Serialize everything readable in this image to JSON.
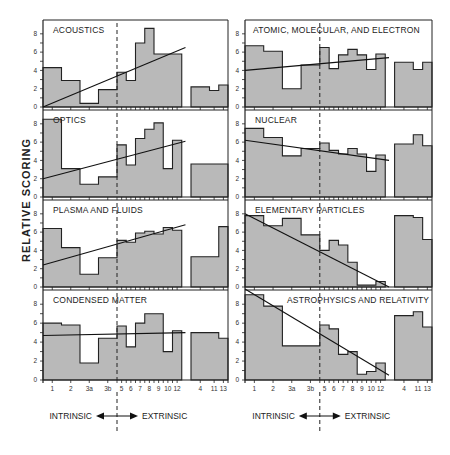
{
  "chart_data": {
    "type": "bar",
    "ylabel": "RELATIVE SCORING",
    "ylim": [
      0,
      9
    ],
    "yticks": [
      0,
      2,
      4,
      6,
      8
    ],
    "categories": [
      "1",
      "2",
      "3a",
      "3b",
      "5",
      "6",
      "7",
      "8",
      "9",
      "10",
      "12",
      "4",
      "11",
      "13"
    ],
    "intrinsic_label": "INTRINSIC",
    "extrinsic_label": "EXTRINSIC",
    "panels": [
      {
        "title": "ACOUSTICS",
        "column": "left",
        "values": [
          4.3,
          2.9,
          0.4,
          1.9,
          3.8,
          2.9,
          7.0,
          8.6,
          5.8,
          5.8,
          5.8,
          2.2,
          1.8,
          2.4
        ],
        "trend": [
          0.0,
          6.5
        ]
      },
      {
        "title": "OPTICS",
        "column": "left",
        "values": [
          8.5,
          3.1,
          1.4,
          2.2,
          5.7,
          3.5,
          6.4,
          7.4,
          8.1,
          3.1,
          6.2,
          3.6,
          3.6,
          3.6
        ],
        "trend": [
          2.0,
          6.1
        ]
      },
      {
        "title": "PLASMA AND FLUIDS",
        "column": "left",
        "values": [
          6.4,
          4.3,
          1.4,
          3.2,
          5.1,
          4.9,
          5.9,
          6.1,
          5.8,
          6.5,
          6.2,
          3.3,
          3.3,
          6.6
        ],
        "trend": [
          2.4,
          6.8
        ]
      },
      {
        "title": "CONDENSED MATTER",
        "column": "left",
        "values": [
          6.0,
          5.8,
          1.8,
          4.4,
          5.7,
          3.5,
          6.0,
          7.0,
          7.0,
          3.0,
          5.2,
          5.0,
          5.0,
          4.4
        ],
        "trend": [
          4.7,
          5.0
        ]
      },
      {
        "title": "ATOMIC, MOLECULAR, AND ELECTRON",
        "column": "right",
        "values": [
          6.7,
          6.1,
          2.0,
          4.6,
          6.5,
          4.2,
          5.7,
          6.3,
          5.7,
          4.1,
          5.8,
          4.9,
          4.1,
          4.9
        ],
        "trend": [
          4.0,
          5.4
        ]
      },
      {
        "title": "NUCLEAR",
        "column": "right",
        "values": [
          7.5,
          6.5,
          4.5,
          5.3,
          5.9,
          5.1,
          4.7,
          5.3,
          4.7,
          2.8,
          4.6,
          5.8,
          6.8,
          5.6
        ],
        "trend": [
          6.2,
          4.0
        ]
      },
      {
        "title": "ELEMENTARY PARTICLES",
        "column": "right",
        "values": [
          7.8,
          6.7,
          7.5,
          5.7,
          4.0,
          5.1,
          4.6,
          2.7,
          0.2,
          0.2,
          0.6,
          7.8,
          7.6,
          5.2
        ],
        "trend": [
          8.0,
          0.0
        ]
      },
      {
        "title": "ASTROPHYSICS AND RELATIVITY",
        "column": "right",
        "values": [
          9.0,
          7.8,
          3.6,
          3.6,
          5.8,
          5.4,
          2.7,
          3.0,
          0.6,
          0.9,
          1.8,
          6.8,
          7.2,
          5.6
        ],
        "trend": [
          9.6,
          0.5
        ]
      }
    ]
  }
}
